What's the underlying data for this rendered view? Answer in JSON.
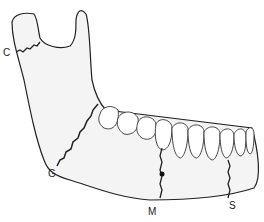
{
  "figure": {
    "labels": [
      {
        "id": "C",
        "text": "C",
        "x": 3,
        "y": 44
      },
      {
        "id": "G",
        "text": "G",
        "x": 48,
        "y": 166
      },
      {
        "id": "M",
        "text": "M",
        "x": 148,
        "y": 206
      },
      {
        "id": "S",
        "text": "S",
        "x": 230,
        "y": 200
      }
    ],
    "colors": {
      "outline": "#222222",
      "fill": "#f4f4f4",
      "tooth_fill": "#ffffff"
    }
  }
}
